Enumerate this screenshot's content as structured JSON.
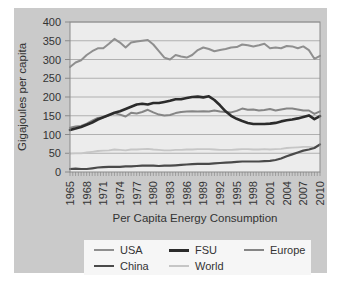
{
  "colors": {
    "page_bg": "#ffffff",
    "card_bg": "#cacaca",
    "plot_bg": "#ececec",
    "grid": "#b0b0b0",
    "frame": "#8a8a8a",
    "text": "#333333",
    "legend_bg": "#f6f6f6"
  },
  "chart_data": {
    "type": "line",
    "title": "Per Capita Energy Consumption",
    "xlabel": "Per Capita Energy Consumption",
    "ylabel": "Gigajoules per capita",
    "ylim": [
      0,
      400
    ],
    "y_ticks": [
      0,
      50,
      100,
      150,
      200,
      250,
      300,
      350,
      400
    ],
    "grid": "horizontal",
    "legend_position": "bottom",
    "x": [
      1965,
      1966,
      1967,
      1968,
      1969,
      1970,
      1971,
      1972,
      1973,
      1974,
      1975,
      1976,
      1977,
      1978,
      1979,
      1980,
      1981,
      1982,
      1983,
      1984,
      1985,
      1986,
      1987,
      1988,
      1989,
      1990,
      1991,
      1992,
      1993,
      1994,
      1995,
      1996,
      1997,
      1998,
      1999,
      2000,
      2001,
      2002,
      2003,
      2004,
      2005,
      2006,
      2007,
      2008,
      2009,
      2010
    ],
    "x_tick_labels": [
      "1965",
      "1968",
      "1971",
      "1974",
      "1977",
      "1980",
      "1983",
      "1986",
      "1989",
      "1992",
      "1995",
      "1998",
      "2001",
      "2004",
      "2007",
      "2010"
    ],
    "series": [
      {
        "name": "USA",
        "color": "#8f8f8f",
        "width": 2,
        "values": [
          280,
          292,
          298,
          312,
          322,
          330,
          330,
          342,
          355,
          345,
          332,
          345,
          348,
          350,
          352,
          340,
          322,
          305,
          300,
          312,
          308,
          305,
          312,
          325,
          332,
          328,
          322,
          325,
          328,
          332,
          333,
          340,
          338,
          335,
          338,
          342,
          330,
          332,
          330,
          336,
          335,
          330,
          335,
          325,
          302,
          310
        ]
      },
      {
        "name": "FSU",
        "color": "#2b2b2b",
        "width": 2.6,
        "values": [
          112,
          116,
          120,
          126,
          132,
          140,
          146,
          152,
          158,
          162,
          168,
          174,
          180,
          182,
          180,
          184,
          184,
          187,
          190,
          194,
          194,
          197,
          200,
          201,
          199,
          202,
          192,
          178,
          162,
          150,
          142,
          136,
          131,
          128,
          128,
          128,
          129,
          131,
          135,
          138,
          140,
          143,
          147,
          151,
          141,
          149
        ]
      },
      {
        "name": "Europe",
        "color": "#858585",
        "width": 2,
        "values": [
          118,
          121,
          123,
          129,
          137,
          144,
          146,
          151,
          157,
          153,
          148,
          158,
          156,
          160,
          166,
          159,
          153,
          151,
          152,
          157,
          160,
          161,
          162,
          161,
          162,
          161,
          164,
          161,
          160,
          159,
          163,
          169,
          166,
          167,
          164,
          165,
          168,
          164,
          167,
          169,
          169,
          167,
          164,
          164,
          155,
          162
        ]
      },
      {
        "name": "China",
        "color": "#4a4a4a",
        "width": 2.2,
        "values": [
          8,
          9,
          8,
          8,
          10,
          12,
          13,
          14,
          14,
          14,
          15,
          15,
          16,
          17,
          17,
          17,
          16,
          17,
          17,
          18,
          19,
          20,
          21,
          22,
          22,
          22,
          23,
          24,
          25,
          26,
          27,
          28,
          28,
          28,
          28,
          29,
          30,
          32,
          36,
          42,
          47,
          52,
          57,
          60,
          64,
          74
        ]
      },
      {
        "name": "World",
        "color": "#c6c6c6",
        "width": 1.8,
        "values": [
          49,
          50,
          50,
          52,
          54,
          56,
          57,
          58,
          60,
          59,
          58,
          60,
          60,
          61,
          62,
          60,
          59,
          58,
          58,
          59,
          59,
          60,
          60,
          61,
          61,
          61,
          60,
          59,
          59,
          59,
          60,
          61,
          61,
          60,
          60,
          61,
          60,
          61,
          62,
          64,
          65,
          66,
          67,
          67,
          66,
          71
        ]
      }
    ]
  }
}
